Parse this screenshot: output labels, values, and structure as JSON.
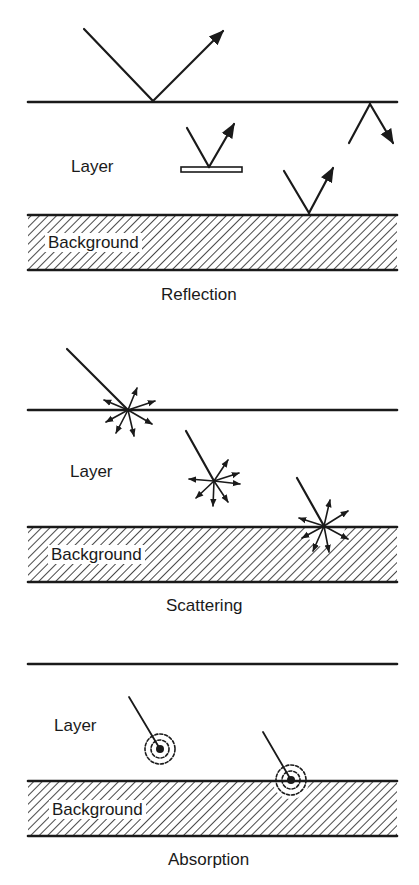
{
  "panels": [
    {
      "caption": "Reflection",
      "layer_label": "Layer",
      "background_label": "Background"
    },
    {
      "caption": "Scattering",
      "layer_label": "Layer",
      "background_label": "Background"
    },
    {
      "caption": "Absorption",
      "layer_label": "Layer",
      "background_label": "Background"
    }
  ],
  "colors": {
    "ink": "#1a1a1a",
    "paper": "#ffffff"
  }
}
